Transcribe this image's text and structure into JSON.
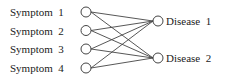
{
  "diagram": {
    "type": "bipartite-graph",
    "left_nodes": [
      {
        "id": "s1",
        "label": "Symptom  1"
      },
      {
        "id": "s2",
        "label": "Symptom  2"
      },
      {
        "id": "s3",
        "label": "Symptom  3"
      },
      {
        "id": "s4",
        "label": "Symptom  4"
      }
    ],
    "right_nodes": [
      {
        "id": "d1",
        "label": "Disease  1"
      },
      {
        "id": "d2",
        "label": "Disease  2"
      }
    ],
    "edges": [
      [
        "s1",
        "d1"
      ],
      [
        "s1",
        "d2"
      ],
      [
        "s2",
        "d1"
      ],
      [
        "s2",
        "d2"
      ],
      [
        "s3",
        "d1"
      ],
      [
        "s3",
        "d2"
      ],
      [
        "s4",
        "d1"
      ],
      [
        "s4",
        "d2"
      ]
    ]
  }
}
